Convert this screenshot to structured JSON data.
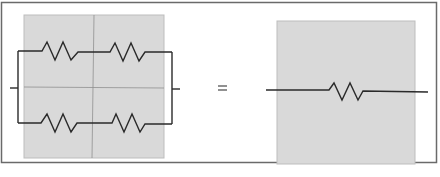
{
  "diagram": {
    "colors": {
      "background": "#ffffff",
      "frame": "#6a6a6a",
      "panel_fill": "#d9d9d9",
      "panel_border": "#bdbdbd",
      "grid_line": "#8f8f8f",
      "wire": "#2a2a2a"
    },
    "left_network": {
      "label": "",
      "branches": [
        {
          "name": "top-branch",
          "resistors": 2
        },
        {
          "name": "bottom-branch",
          "resistors": 2
        }
      ]
    },
    "operator": "=",
    "right_network": {
      "label": "",
      "resistors": 1
    }
  }
}
